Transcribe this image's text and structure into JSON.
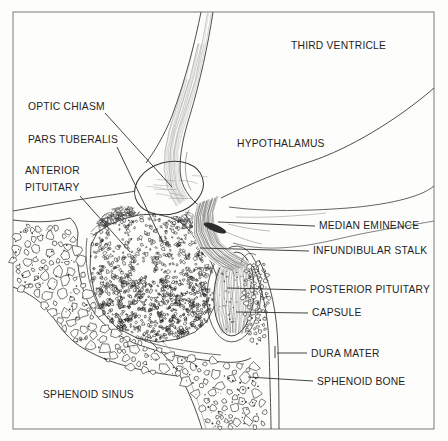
{
  "figure": {
    "kind": "anatomical line drawing, midsagittal section of pituitary region"
  },
  "colors": {
    "paper": "#fdfdfb",
    "ink": "#2a2a2a",
    "frame": "#7a7a7a"
  },
  "labels": {
    "third_ventricle": "THIRD VENTRICLE",
    "optic_chiasm": "OPTIC CHIASM",
    "pars_tuberalis": "PARS TUBERALIS",
    "anterior_pituitary_line1": "ANTERIOR",
    "anterior_pituitary_line2": "PITUITARY",
    "hypothalamus": "HYPOTHALAMUS",
    "median_eminence": "MEDIAN EMINENCE",
    "infundibular_stalk": "INFUNDIBULAR STALK",
    "posterior_pituitary": "POSTERIOR PITUITARY",
    "capsule": "CAPSULE",
    "dura_mater": "DURA MATER",
    "sphenoid_bone": "SPHENOID BONE",
    "sphenoid_sinus": "SPHENOID SINUS"
  }
}
